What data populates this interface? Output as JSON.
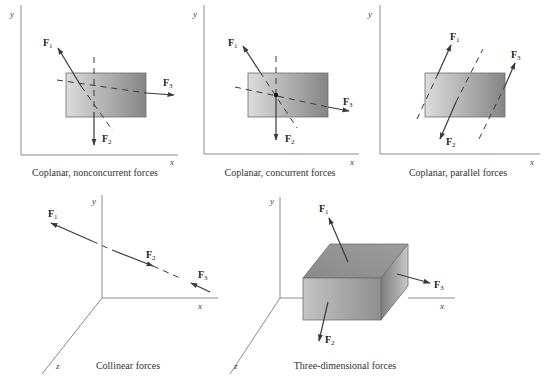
{
  "colors": {
    "gradient_light": "#dcdcdc",
    "gradient_dark": "#858585",
    "line": "#3a3a3a",
    "axis": "#8c8c8c"
  },
  "panels": [
    {
      "id": "coplanar-nonconcurrent",
      "caption": "Coplanar, nonconcurrent forces",
      "axes": {
        "x": "x",
        "y": "y"
      },
      "forces": [
        {
          "name": "F",
          "sub": "1"
        },
        {
          "name": "F",
          "sub": "2"
        },
        {
          "name": "F",
          "sub": "3"
        }
      ]
    },
    {
      "id": "coplanar-concurrent",
      "caption": "Coplanar, concurrent forces",
      "axes": {
        "x": "x",
        "y": "y"
      },
      "forces": [
        {
          "name": "F",
          "sub": "1"
        },
        {
          "name": "F",
          "sub": "2"
        },
        {
          "name": "F",
          "sub": "3"
        }
      ]
    },
    {
      "id": "coplanar-parallel",
      "caption": "Coplanar, parallel forces",
      "axes": {
        "x": "x",
        "y": "y"
      },
      "forces": [
        {
          "name": "F",
          "sub": "1"
        },
        {
          "name": "F",
          "sub": "2"
        },
        {
          "name": "F",
          "sub": "3"
        }
      ]
    },
    {
      "id": "collinear",
      "caption": "Collinear forces",
      "axes": {
        "x": "x",
        "y": "y",
        "z": "z"
      },
      "forces": [
        {
          "name": "F",
          "sub": "1"
        },
        {
          "name": "F",
          "sub": "2"
        },
        {
          "name": "F",
          "sub": "3"
        }
      ]
    },
    {
      "id": "three-dimensional",
      "caption": "Three-dimensional forces",
      "axes": {
        "x": "x",
        "y": "y",
        "z": "z"
      },
      "forces": [
        {
          "name": "F",
          "sub": "1"
        },
        {
          "name": "F",
          "sub": "2"
        },
        {
          "name": "F",
          "sub": "3"
        }
      ]
    }
  ]
}
